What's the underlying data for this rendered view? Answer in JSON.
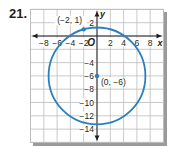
{
  "problem": {
    "number": "21."
  },
  "chart_data": {
    "type": "scatter",
    "title": "",
    "xlabel": "x",
    "ylabel": "y",
    "origin_label": "O",
    "xlim": [
      -10,
      10
    ],
    "ylim": [
      -16,
      4
    ],
    "grid": true,
    "grid_step": 2,
    "x_ticks": [
      -8,
      -6,
      -4,
      -2,
      2,
      4,
      6,
      8
    ],
    "x_tick_labels": [
      "−8",
      "−6",
      "−4",
      "−2",
      "2",
      "4",
      "6",
      "8"
    ],
    "y_ticks": [
      2,
      -4,
      -6,
      -8,
      -10,
      -12,
      -14
    ],
    "y_tick_labels": [
      "2",
      "−4",
      "−6",
      "−8",
      "−10",
      "−12",
      "−14"
    ],
    "circle": {
      "center": [
        0,
        -6
      ],
      "radius": 7.28,
      "radius_squared": 53
    },
    "points": [
      {
        "x": -2,
        "y": 1,
        "label": "(−2, 1)"
      },
      {
        "x": 0,
        "y": -6,
        "label": "(0, −6)"
      }
    ],
    "colors": {
      "curve": "#2b7fc1",
      "grid": "#bdbdbd",
      "axis": "#231f20",
      "shadow": "#9a9a9a"
    }
  }
}
